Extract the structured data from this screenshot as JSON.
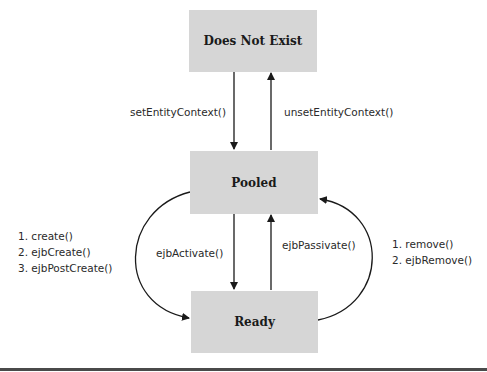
{
  "diagram": {
    "states": {
      "does_not_exist": "Does Not Exist",
      "pooled": "Pooled",
      "ready": "Ready"
    },
    "transitions": {
      "set_entity_context": "setEntityContext()",
      "unset_entity_context": "unsetEntityContext()",
      "ejb_activate": "ejbActivate()",
      "ejb_passivate": "ejbPassivate()",
      "create_sequence": [
        "1. create()",
        "2. ejbCreate()",
        "3. ejbPostCreate()"
      ],
      "remove_sequence": [
        "1. remove()",
        "2. ejbRemove()"
      ]
    },
    "colors": {
      "state_fill": "#d6d6d6",
      "edge": "#1a1a1a",
      "rule": "#4a4a4a"
    }
  }
}
